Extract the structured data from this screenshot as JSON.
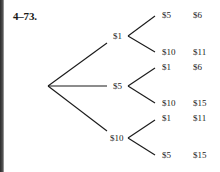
{
  "title": "4–73.",
  "tree": {
    "level1": [
      {
        "label": "$1"
      },
      {
        "label": "$5"
      },
      {
        "label": "$10"
      }
    ],
    "leaves": [
      {
        "label": "$5",
        "total": "$6"
      },
      {
        "label": "$10",
        "total": "$11"
      },
      {
        "label": "$1",
        "total": "$6"
      },
      {
        "label": "$10",
        "total": "$15"
      },
      {
        "label": "$1",
        "total": "$11"
      },
      {
        "label": "$5",
        "total": "$15"
      }
    ]
  },
  "colors": {
    "line": "#1a1a1a",
    "background": "#ffffff"
  }
}
